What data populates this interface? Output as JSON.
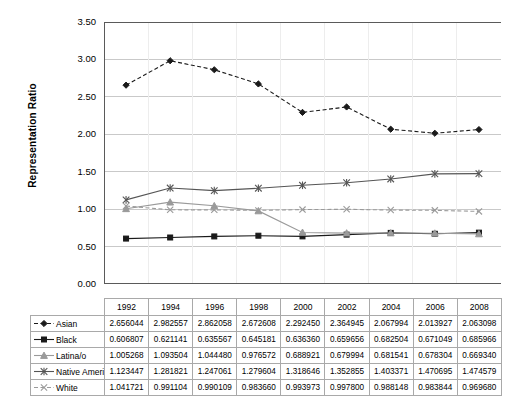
{
  "chart_data": {
    "type": "line",
    "title": "",
    "xlabel": "",
    "ylabel": "Representation Ratio",
    "ylim": [
      0.0,
      3.5
    ],
    "ytick_step": 0.5,
    "yticks": [
      "0.00",
      "0.50",
      "1.00",
      "1.50",
      "2.00",
      "2.50",
      "3.00",
      "3.50"
    ],
    "grid": true,
    "legend_position": "table-below",
    "categories": [
      "1992",
      "1994",
      "1996",
      "1998",
      "2000",
      "2002",
      "2004",
      "2006",
      "2008"
    ],
    "series": [
      {
        "name": "Asian",
        "marker": "diamond",
        "line_style": "dashed",
        "color": "#1a1a1a",
        "values": [
          2.656044,
          2.982557,
          2.862058,
          2.672608,
          2.29245,
          2.364945,
          2.067994,
          2.013927,
          2.063098
        ],
        "labels": [
          "2.656044",
          "2.982557",
          "2.862058",
          "2.672608",
          "2.292450",
          "2.364945",
          "2.067994",
          "2.013927",
          "2.063098"
        ]
      },
      {
        "name": "Black",
        "marker": "square",
        "line_style": "solid",
        "color": "#1a1a1a",
        "values": [
          0.606807,
          0.621141,
          0.635567,
          0.645181,
          0.63636,
          0.659656,
          0.682504,
          0.671049,
          0.685966
        ],
        "labels": [
          "0.606807",
          "0.621141",
          "0.635567",
          "0.645181",
          "0.636360",
          "0.659656",
          "0.682504",
          "0.671049",
          "0.685966"
        ]
      },
      {
        "name": "Latina/o",
        "marker": "triangle",
        "line_style": "solid",
        "color": "#9a9a9a",
        "values": [
          1.005268,
          1.093504,
          1.04448,
          0.976572,
          0.688921,
          0.679994,
          0.681541,
          0.678304,
          0.66934
        ],
        "labels": [
          "1.005268",
          "1.093504",
          "1.044480",
          "0.976572",
          "0.688921",
          "0.679994",
          "0.681541",
          "0.678304",
          "0.669340"
        ]
      },
      {
        "name": "Native American",
        "marker": "asterisk",
        "line_style": "solid",
        "color": "#555555",
        "values": [
          1.123447,
          1.281821,
          1.247061,
          1.279604,
          1.318646,
          1.352855,
          1.403371,
          1.470695,
          1.474579
        ],
        "labels": [
          "1.123447",
          "1.281821",
          "1.247061",
          "1.279604",
          "1.318646",
          "1.352855",
          "1.403371",
          "1.470695",
          "1.474579"
        ]
      },
      {
        "name": "White",
        "marker": "cross",
        "line_style": "dashed",
        "color": "#9a9a9a",
        "values": [
          1.041721,
          0.991104,
          0.990109,
          0.98366,
          0.993973,
          0.9978,
          0.988148,
          0.983844,
          0.96968
        ],
        "labels": [
          "1.041721",
          "0.991104",
          "0.990109",
          "0.983660",
          "0.993973",
          "0.997800",
          "0.988148",
          "0.983844",
          "0.969680"
        ]
      }
    ]
  },
  "axis": {
    "y_title": "Representation Ratio"
  }
}
